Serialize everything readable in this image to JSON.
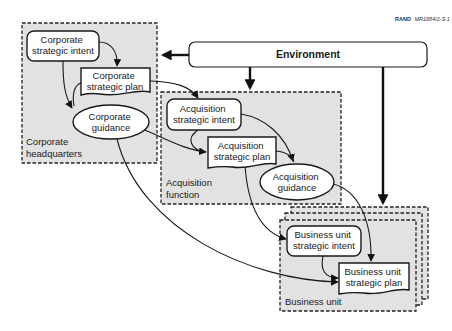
{
  "credit": {
    "org": "RAND",
    "id": "MR1684/2-S.1"
  },
  "environment": {
    "label": "Environment"
  },
  "regions": {
    "corporate": {
      "line1": "Corporate",
      "line2": "headquarters"
    },
    "acquisition": {
      "line1": "Acquisition",
      "line2": "function"
    },
    "business_unit": {
      "line1": "Business unit"
    }
  },
  "nodes": {
    "corp_intent": {
      "line1": "Corporate",
      "line2": "strategic intent",
      "shape": "rounded-rect"
    },
    "corp_plan": {
      "line1": "Corporate",
      "line2": "strategic plan",
      "shape": "document"
    },
    "corp_guidance": {
      "line1": "Corporate",
      "line2": "guidance",
      "shape": "ellipse"
    },
    "acq_intent": {
      "line1": "Acquisition",
      "line2": "strategic intent",
      "shape": "rounded-rect"
    },
    "acq_plan": {
      "line1": "Acquisition",
      "line2": "strategic plan",
      "shape": "document"
    },
    "acq_guidance": {
      "line1": "Acquisition",
      "line2": "guidance",
      "shape": "ellipse"
    },
    "bu_intent": {
      "line1": "Business unit",
      "line2": "strategic intent",
      "shape": "rounded-rect"
    },
    "bu_plan": {
      "line1": "Business unit",
      "line2": "strategic plan",
      "shape": "document"
    }
  },
  "edges": [
    {
      "from": "environment",
      "to": "corporate",
      "style": "bold"
    },
    {
      "from": "environment",
      "to": "acquisition",
      "style": "bold"
    },
    {
      "from": "environment",
      "to": "business_unit",
      "style": "bold"
    },
    {
      "from": "corp_intent",
      "to": "corp_plan"
    },
    {
      "from": "corp_intent",
      "to": "corp_guidance"
    },
    {
      "from": "corp_plan",
      "to": "corp_guidance"
    },
    {
      "from": "corp_plan",
      "to": "acq_intent"
    },
    {
      "from": "corp_guidance",
      "to": "acq_plan"
    },
    {
      "from": "corp_guidance",
      "to": "bu_plan"
    },
    {
      "from": "acq_intent",
      "to": "acq_plan"
    },
    {
      "from": "acq_intent",
      "to": "acq_guidance"
    },
    {
      "from": "acq_plan",
      "to": "acq_guidance"
    },
    {
      "from": "acq_plan",
      "to": "bu_intent"
    },
    {
      "from": "acq_guidance",
      "to": "bu_plan"
    },
    {
      "from": "bu_intent",
      "to": "bu_plan"
    }
  ],
  "colors": {
    "region_fill": "#e2e2e2",
    "stroke": "#1a1a1a",
    "node_fill": "#ffffff"
  }
}
